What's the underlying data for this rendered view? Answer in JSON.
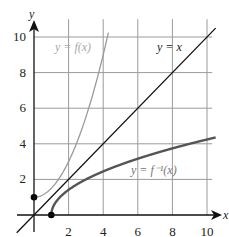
{
  "chart_data": {
    "type": "line",
    "title": "",
    "xlabel": "x",
    "ylabel": "y",
    "xlim": [
      -1,
      10.5
    ],
    "ylim": [
      -1,
      11
    ],
    "grid": true,
    "x_ticks": [
      "2",
      "4",
      "6",
      "8",
      "10"
    ],
    "y_ticks": [
      "2",
      "4",
      "6",
      "8",
      "10"
    ],
    "series": [
      {
        "name": "y = f(x)",
        "color": "#9a9a9a",
        "x": [
          0,
          0.5,
          1,
          1.5,
          2,
          2.5,
          3,
          3.5,
          4,
          4.24
        ],
        "y": [
          1,
          1.125,
          1.5,
          2.125,
          3,
          4.125,
          5.5,
          7.125,
          9,
          10
        ],
        "marker_start": {
          "x": 0,
          "y": 1
        }
      },
      {
        "name": "y = x",
        "color": "#111111",
        "x": [
          -1,
          10.5
        ],
        "y": [
          -1,
          10.5
        ]
      },
      {
        "name": "y = f⁻¹(x)",
        "color": "#555555",
        "x": [
          1,
          1.125,
          1.5,
          2.125,
          3,
          4.125,
          5.5,
          7.125,
          9,
          10.5
        ],
        "y": [
          0,
          0.5,
          1,
          1.5,
          2,
          2.5,
          3,
          3.5,
          4,
          4.36
        ],
        "marker_start": {
          "x": 1,
          "y": 0
        }
      }
    ],
    "annotations": [
      {
        "text": "y = f(x)",
        "x": 3,
        "y": 10
      },
      {
        "text": "y = x",
        "x": 8,
        "y": 10
      },
      {
        "text": "y = f⁻¹(x)",
        "x": 7,
        "y": 2.7
      }
    ]
  },
  "labels": {
    "x_axis": "x",
    "y_axis": "y",
    "f_label": "y = f(x)",
    "identity_label": "y = x",
    "inverse_label": "y = f⁻¹(x)"
  }
}
